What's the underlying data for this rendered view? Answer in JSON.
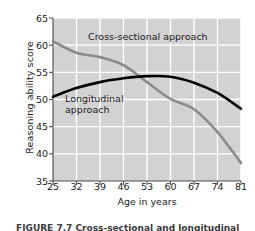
{
  "chart_data": {
    "type": "line",
    "title": "",
    "xlabel": "Age in years",
    "ylabel": "Reasoning ability score",
    "xticks": [
      25,
      32,
      39,
      46,
      53,
      60,
      67,
      74,
      81
    ],
    "yticks": [
      35,
      40,
      45,
      50,
      55,
      60,
      65
    ],
    "xlim": [
      25,
      81
    ],
    "ylim": [
      35,
      65
    ],
    "grid": true,
    "legend_position": "inline-annotation",
    "plot_background": "#d2d2d2",
    "gridline_color": "#ffffff",
    "series": [
      {
        "name": "Cross-sectional approach",
        "color": "#8c8c8c",
        "x": [
          25,
          32,
          39,
          46,
          53,
          60,
          67,
          74,
          81
        ],
        "values": [
          60.7,
          58.6,
          57.8,
          56.3,
          53.2,
          50.1,
          48.2,
          44.0,
          38.3
        ]
      },
      {
        "name": "Longitudinal approach",
        "color": "#000000",
        "x": [
          25,
          32,
          39,
          46,
          53,
          60,
          67,
          74,
          81
        ],
        "values": [
          50.5,
          52.1,
          53.2,
          53.9,
          54.3,
          54.2,
          53.1,
          51.2,
          48.3
        ]
      }
    ],
    "annotations": [
      {
        "name": "cross-sectional-label",
        "text": "Cross-sectional approach"
      },
      {
        "name": "longitudinal-label",
        "text": "Longitudinal\napproach"
      }
    ]
  },
  "caption": "FIGURE 7.7    Cross-sectional and longitudinal"
}
